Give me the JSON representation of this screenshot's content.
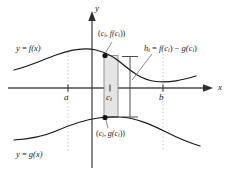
{
  "figure": {
    "kind": "area-between-curves-diagram",
    "background_color": "#ffffff",
    "curve_color": "#1a1a1a",
    "axis_color": "#555555",
    "rect_fill": "#e2e2e2",
    "rect_stroke": "#777777",
    "dotted_color": "#bbbbbb",
    "point_color": "#111111"
  },
  "axes": {
    "x_label": "x",
    "y_label": "y",
    "origin": {
      "x": 92,
      "y": 88
    }
  },
  "ticks": [
    {
      "name": "a",
      "label": "a",
      "x": 68
    },
    {
      "name": "c_i",
      "label": "c",
      "sub": "i",
      "x": 110
    },
    {
      "name": "b",
      "label": "b",
      "x": 163
    }
  ],
  "labels": {
    "f_curve": {
      "lhs": "y",
      "eq": "=",
      "fn": "f(x)"
    },
    "g_curve": {
      "lhs": "y",
      "eq": "=",
      "fn": "g(x)"
    },
    "top_point": {
      "open": "(",
      "c": "c",
      "sub": "i",
      "comma": ",",
      "f": "f(c",
      "sub2": "i",
      "close": "))"
    },
    "bottom_point": {
      "open": "(",
      "c": "c",
      "sub": "i",
      "comma": ",",
      "g": "g(c",
      "sub2": "i",
      "close": "))"
    },
    "height": {
      "h": "h",
      "sub": "i",
      "eq": "=",
      "f": "f(c",
      "sub2": "i",
      "minus": ") − ",
      "g": "g(c",
      "sub3": "i",
      "close": ")"
    }
  },
  "text": {
    "y_axis": "y",
    "x_axis": "x",
    "f_equation": "y = f(x)",
    "g_equation": "y = g(x)",
    "tick_a": "a",
    "tick_b": "b",
    "tick_ci_base": "c",
    "tick_ci_sub": "i",
    "point_top": "(c, f(c))",
    "point_bottom": "(c, g(c))",
    "height_label": "h = f(c) − g(c)"
  }
}
